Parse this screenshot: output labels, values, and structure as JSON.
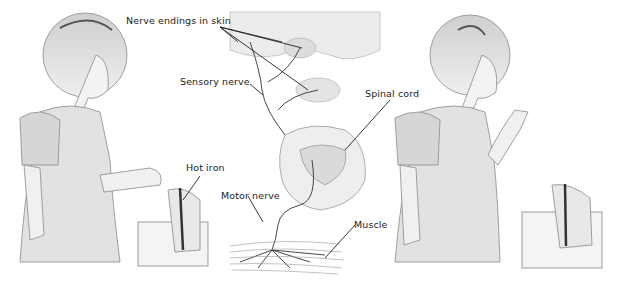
{
  "diagram": {
    "labels": {
      "nerve_endings": "Nerve endings in skin",
      "sensory_nerve": "Sensory nerve",
      "spinal_cord": "Spinal cord",
      "hot_iron": "Hot iron",
      "motor_nerve": "Motor nerve",
      "muscle": "Muscle"
    },
    "panels": [
      {
        "name": "girl-touching-iron",
        "description": "Girl touching a hot iron with her hand"
      },
      {
        "name": "nerve-pathway",
        "description": "Skin nerve endings, sensory nerve, spinal cord cross-section, motor nerve, muscle"
      },
      {
        "name": "girl-withdrawn-hand",
        "description": "Girl pulling her hand away from the iron"
      }
    ],
    "colors": {
      "line": "#222222",
      "sketch": "#8a8a8a",
      "fill": "#e6e6e6",
      "background": "#ffffff"
    }
  }
}
